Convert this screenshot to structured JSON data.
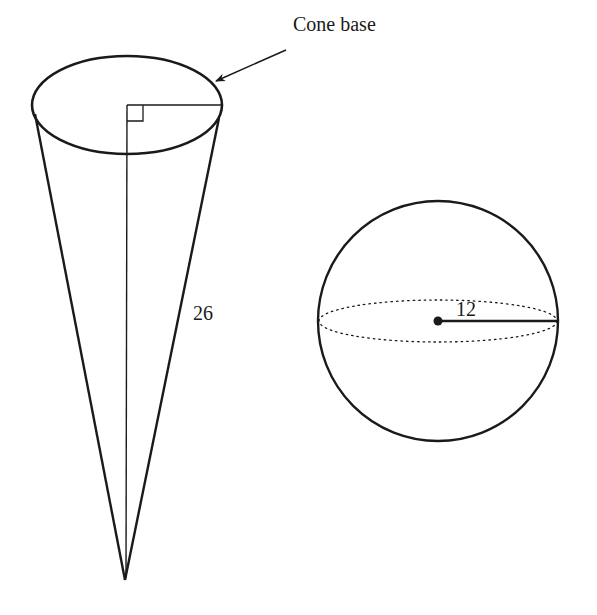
{
  "figure": {
    "cone": {
      "base_label": "Cone base",
      "slant_height_label": "26"
    },
    "sphere": {
      "radius_label": "12"
    }
  },
  "colors": {
    "stroke": "#1a1a1a",
    "background": "#ffffff"
  }
}
